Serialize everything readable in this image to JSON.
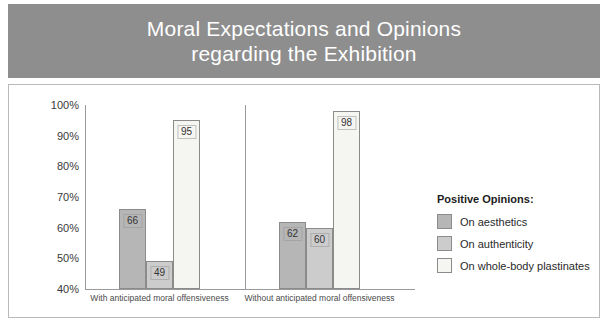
{
  "title": {
    "line1": "Moral Expectations and Opinions",
    "line2": "regarding the Exhibition",
    "full": "Moral Expectations and Opinions\nregarding the Exhibition"
  },
  "colors": {
    "title_band": "#8e8e8e",
    "title_text": "#ffffff",
    "frame_border": "#b9b9b9",
    "axis": "#9a9a9a",
    "series_aesthetics": "#b6b6b6",
    "series_authenticity": "#cccccc",
    "series_plastinates": "#f5f5f2",
    "bar_outline": "#8b8b8b"
  },
  "legend": {
    "title": "Positive Opinions:",
    "items": [
      {
        "label": "On aesthetics",
        "color": "#b6b6b6"
      },
      {
        "label": "On authenticity",
        "color": "#cccccc"
      },
      {
        "label": "On whole-body plastinates",
        "color": "#f5f5f2"
      }
    ]
  },
  "axis": {
    "y_ticks": [
      "100%",
      "90%",
      "80%",
      "70%",
      "60%",
      "50%",
      "40%"
    ],
    "y_min": 40,
    "y_max": 100,
    "y_step": 10
  },
  "chart_data": {
    "type": "bar",
    "title": "Moral Expectations and Opinions regarding the Exhibition",
    "xlabel": "",
    "ylabel": "",
    "ylim": [
      40,
      100
    ],
    "ytick_labels": [
      "40%",
      "50%",
      "60%",
      "70%",
      "80%",
      "90%",
      "100%"
    ],
    "grid": false,
    "legend_position": "right",
    "legend_title": "Positive Opinions:",
    "categories": [
      "With anticipated moral offensiveness",
      "Without anticipated moral offensiveness"
    ],
    "series": [
      {
        "name": "On aesthetics",
        "values": [
          66,
          49
        ],
        "color": "#b6b6b6"
      },
      {
        "name": "On authenticity",
        "values": [
          49,
          60
        ],
        "color": "#cccccc"
      },
      {
        "name": "On whole-body plastinates",
        "values": [
          95,
          98
        ],
        "color": "#f5f5f2"
      }
    ],
    "groups": [
      {
        "label": "With anticipated moral offensiveness",
        "bars": [
          {
            "series": "On aesthetics",
            "value": 66,
            "label": "66",
            "color": "#b6b6b6"
          },
          {
            "series": "On authenticity",
            "value": 49,
            "label": "49",
            "color": "#cccccc"
          },
          {
            "series": "On whole-body plastinates",
            "value": 95,
            "label": "95",
            "color": "#f5f5f2"
          }
        ]
      },
      {
        "label": "Without anticipated moral offensiveness",
        "bars": [
          {
            "series": "On aesthetics",
            "value": 62,
            "label": "62",
            "color": "#b6b6b6"
          },
          {
            "series": "On authenticity",
            "value": 60,
            "label": "60",
            "color": "#cccccc"
          },
          {
            "series": "On whole-body plastinates",
            "value": 98,
            "label": "98",
            "color": "#f5f5f2"
          }
        ]
      }
    ]
  }
}
